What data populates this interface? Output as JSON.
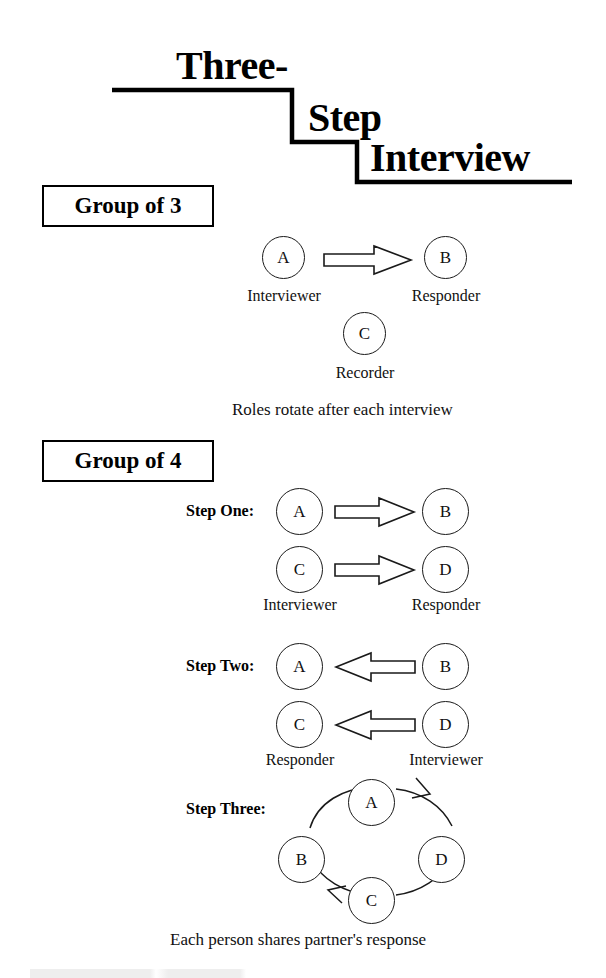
{
  "title": {
    "line1": "Three-",
    "line2": "Step",
    "line3": "Interview"
  },
  "sections": {
    "group_of_3": {
      "heading": "Group of 3",
      "nodes": [
        {
          "letter": "A",
          "role": "Interviewer"
        },
        {
          "letter": "B",
          "role": "Responder"
        },
        {
          "letter": "C",
          "role": "Recorder"
        }
      ],
      "arrow_direction": "right",
      "caption": "Roles rotate after each interview"
    },
    "group_of_4": {
      "heading": "Group of 4",
      "steps": [
        {
          "label": "Step One:",
          "arrow_direction": "right",
          "rows": [
            {
              "from": "A",
              "to": "B"
            },
            {
              "from": "C",
              "to": "D"
            }
          ],
          "left_role": "Interviewer",
          "right_role": "Responder"
        },
        {
          "label": "Step Two:",
          "arrow_direction": "left",
          "rows": [
            {
              "from": "B",
              "to": "A"
            },
            {
              "from": "D",
              "to": "C"
            }
          ],
          "left_role": "Responder",
          "right_role": "Interviewer"
        },
        {
          "label": "Step Three:",
          "cycle": {
            "nodes": [
              "A",
              "B",
              "C",
              "D"
            ],
            "top": "A",
            "left": "B",
            "bottom": "C",
            "right": "D",
            "order": "B to A to D to C to B",
            "direction": "clockwise"
          },
          "caption": "Each person shares partner's response"
        }
      ]
    }
  },
  "colors": {
    "ink": "#000000",
    "stroke": "#1a1a1a",
    "paper": "#ffffff"
  }
}
